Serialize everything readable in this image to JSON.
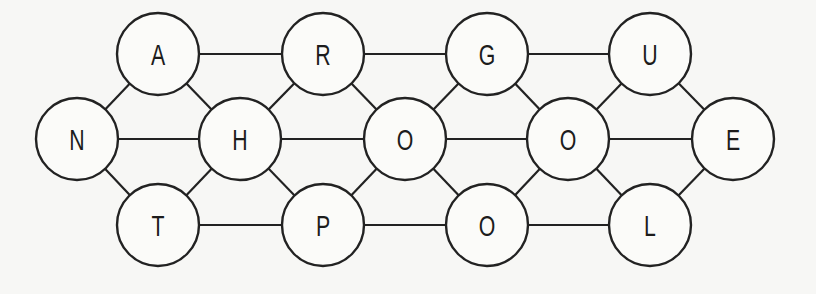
{
  "diagram": {
    "title": "",
    "node_radius": 41,
    "colors": {
      "stroke": "#222222",
      "fill": "#fbfbf9",
      "background": "#f7f7f5",
      "text": "#1c1c1c"
    },
    "nodes": [
      {
        "id": "n1",
        "label": "A",
        "x": 158,
        "y": 54
      },
      {
        "id": "n2",
        "label": "R",
        "x": 323,
        "y": 54
      },
      {
        "id": "n3",
        "label": "G",
        "x": 487,
        "y": 54
      },
      {
        "id": "n4",
        "label": "U",
        "x": 650,
        "y": 54
      },
      {
        "id": "n5",
        "label": "N",
        "x": 77,
        "y": 139
      },
      {
        "id": "n6",
        "label": "H",
        "x": 240,
        "y": 139
      },
      {
        "id": "n7",
        "label": "O",
        "x": 405,
        "y": 139
      },
      {
        "id": "n8",
        "label": "O",
        "x": 568,
        "y": 139
      },
      {
        "id": "n9",
        "label": "E",
        "x": 733,
        "y": 139
      },
      {
        "id": "n10",
        "label": "T",
        "x": 158,
        "y": 225
      },
      {
        "id": "n11",
        "label": "P",
        "x": 323,
        "y": 225
      },
      {
        "id": "n12",
        "label": "O",
        "x": 487,
        "y": 225
      },
      {
        "id": "n13",
        "label": "L",
        "x": 650,
        "y": 225
      }
    ],
    "edges": [
      [
        "n1",
        "n2"
      ],
      [
        "n2",
        "n3"
      ],
      [
        "n3",
        "n4"
      ],
      [
        "n5",
        "n6"
      ],
      [
        "n6",
        "n7"
      ],
      [
        "n7",
        "n8"
      ],
      [
        "n8",
        "n9"
      ],
      [
        "n10",
        "n11"
      ],
      [
        "n11",
        "n12"
      ],
      [
        "n12",
        "n13"
      ],
      [
        "n5",
        "n1"
      ],
      [
        "n5",
        "n10"
      ],
      [
        "n1",
        "n6"
      ],
      [
        "n10",
        "n6"
      ],
      [
        "n6",
        "n2"
      ],
      [
        "n6",
        "n11"
      ],
      [
        "n2",
        "n7"
      ],
      [
        "n11",
        "n7"
      ],
      [
        "n7",
        "n3"
      ],
      [
        "n7",
        "n12"
      ],
      [
        "n3",
        "n8"
      ],
      [
        "n12",
        "n8"
      ],
      [
        "n8",
        "n4"
      ],
      [
        "n8",
        "n13"
      ],
      [
        "n4",
        "n9"
      ],
      [
        "n13",
        "n9"
      ]
    ]
  }
}
